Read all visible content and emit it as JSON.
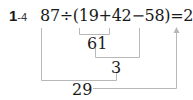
{
  "problem": {
    "number": "1",
    "sub": "-4",
    "expression": "87÷(19+42−58)=29"
  },
  "steps": [
    {
      "operation": "19+42",
      "result": "61"
    },
    {
      "operation": "61−58",
      "result": "3"
    },
    {
      "operation": "87÷3",
      "result": "29"
    }
  ],
  "colors": {
    "text": "#1a1a1a",
    "connector": "#b8b8b8"
  }
}
